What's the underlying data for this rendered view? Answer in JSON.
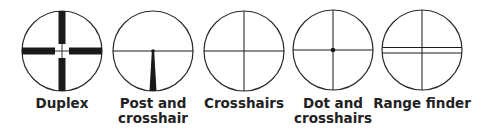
{
  "figure": {
    "stroke_color": "#2a2a2a",
    "text_color": "#222222",
    "background": "#ffffff"
  },
  "reticles": [
    {
      "id": "duplex",
      "label": "Duplex",
      "label_lines": [
        "Duplex"
      ],
      "cx": 62,
      "cy": 51,
      "r": 40
    },
    {
      "id": "post-and-crosshair",
      "label": "Post and crosshair",
      "label_lines": [
        "Post and",
        "crosshair"
      ],
      "cx": 153,
      "cy": 51,
      "r": 40
    },
    {
      "id": "crosshairs",
      "label": "Crosshairs",
      "label_lines": [
        "Crosshairs"
      ],
      "cx": 244,
      "cy": 51,
      "r": 40
    },
    {
      "id": "dot-and-crosshairs",
      "label": "Dot and crosshairs",
      "label_lines": [
        "Dot and",
        "crosshairs"
      ],
      "cx": 333,
      "cy": 50,
      "r": 40
    },
    {
      "id": "range-finder",
      "label": "Range finder",
      "label_lines": [
        "Range finder"
      ],
      "cx": 422,
      "cy": 50,
      "r": 40
    }
  ]
}
